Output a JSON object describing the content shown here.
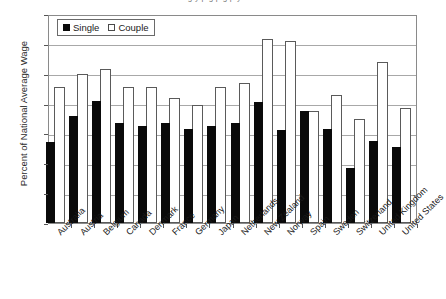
{
  "top_caption": "g y p g p g p y",
  "legend": {
    "single_label": "Single",
    "couple_label": "Couple",
    "single_color": "#000000",
    "couple_color": "#ffffff"
  },
  "axis": {
    "ylabel": "Percent of National Average Wage",
    "yticks": [
      "0",
      "10",
      "20",
      "30",
      "40",
      "50",
      "60",
      "70"
    ]
  },
  "chart_data": {
    "type": "bar",
    "title": "",
    "subtitle": "",
    "xlabel": "",
    "ylabel": "Percent of National Average Wage",
    "ylim": [
      0,
      70
    ],
    "ytick_step": 10,
    "grid": true,
    "legend_position": "top-left",
    "bar_style": "overlapped",
    "categories": [
      "Australia",
      "Austria",
      "Belgium",
      "Canada",
      "Denmark",
      "France",
      "Germany",
      "Japan",
      "Netherlands",
      "New Zealand",
      "Norway",
      "Spain",
      "Sweden",
      "Switzerland",
      "United Kingdom",
      "United States"
    ],
    "series": [
      {
        "name": "Single",
        "color": "#000000",
        "values": [
          27,
          36,
          41,
          33.5,
          32.5,
          33.5,
          31.5,
          32.5,
          33.5,
          40.5,
          31,
          37.5,
          31.5,
          18.5,
          27.5,
          25.5
        ]
      },
      {
        "name": "Couple",
        "color": "#ffffff",
        "values": [
          45.5,
          50,
          51.5,
          45.5,
          45.5,
          42,
          39.5,
          45.5,
          47,
          61.5,
          61,
          37.5,
          43,
          35,
          54,
          38.5
        ]
      }
    ]
  }
}
